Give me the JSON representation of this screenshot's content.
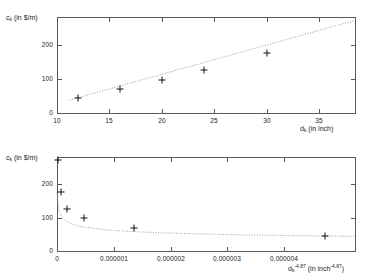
{
  "figure": {
    "background": "#ffffff",
    "frame_color": "#5a5a5a",
    "marker_color": "#111111",
    "fit_color": "#9a9a9a"
  },
  "charts": [
    {
      "id": "top",
      "type": "scatter",
      "title": "",
      "xlabel_parts": {
        "base": "d",
        "sub": "k",
        "rest": " (in inch)"
      },
      "ylabel_parts": {
        "base": "c",
        "sub": "k",
        "rest": " (in $/m)"
      },
      "xlabel": "d_k (in inch)",
      "ylabel": "c_k (in $/m)",
      "xlim": [
        10,
        38.4
      ],
      "ylim": [
        0,
        282
      ],
      "xticks": [
        10,
        15,
        20,
        25,
        30,
        35
      ],
      "xticklabels": [
        "10",
        "15",
        "20",
        "25",
        "30",
        "35"
      ],
      "yticks": [
        0,
        100,
        200
      ],
      "yticklabels": [
        "0",
        "100",
        "200"
      ],
      "grid": false,
      "legend": "none",
      "points": {
        "x": [
          12,
          16,
          20,
          24,
          30
        ],
        "y": [
          45,
          70,
          98,
          126,
          176
        ]
      },
      "fit": {
        "style": "dotted",
        "x": [
          11.2,
          38.4
        ],
        "y": [
          38,
          272
        ]
      }
    },
    {
      "id": "bottom",
      "type": "scatter",
      "title": "",
      "xlabel_parts": {
        "base": "d",
        "sub": "k",
        "sup": "-4.87",
        "rest": " (in inch",
        "rest_sup": "-4.87",
        "rest_end": ")"
      },
      "ylabel_parts": {
        "base": "c",
        "sub": "k",
        "rest": " (in $/m)"
      },
      "xlabel": "d_k^-4.87 (in inch^-4.87)",
      "ylabel": "c_k (in $/m)",
      "xlim": [
        0,
        5.25e-06
      ],
      "ylim": [
        0,
        282
      ],
      "xticks": [
        0,
        1e-06,
        2e-06,
        3e-06,
        4e-06
      ],
      "xticklabels": [
        "0",
        "0.000001",
        "0.000002",
        "0.000003",
        "0.000004"
      ],
      "yticks": [
        0,
        100,
        200
      ],
      "yticklabels": [
        "0",
        "100",
        "200"
      ],
      "grid": false,
      "legend": "none",
      "points": {
        "x": [
          1.2e-08,
          6.5e-08,
          1.75e-07,
          4.7e-07,
          1.36e-06,
          4.72e-06
        ],
        "y": [
          272,
          176,
          126,
          98,
          70,
          45
        ]
      },
      "fit": {
        "style": "dotted",
        "note": "decaying power-law curve through the markers"
      }
    }
  ]
}
